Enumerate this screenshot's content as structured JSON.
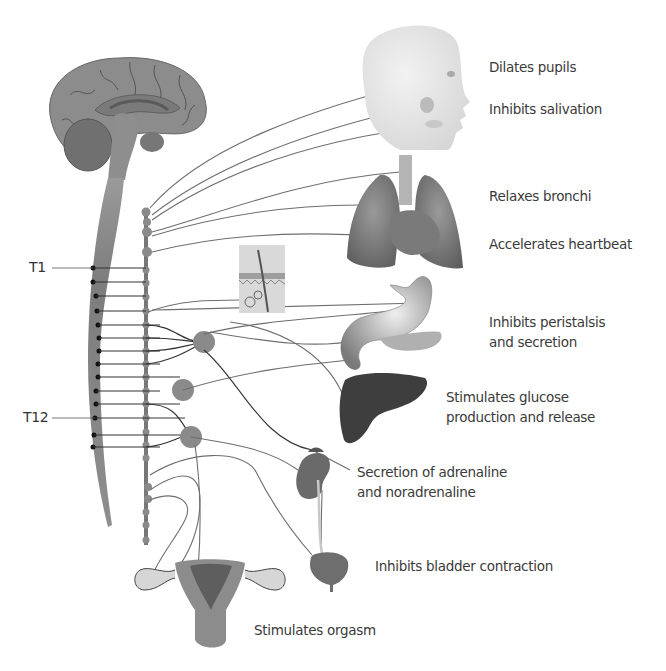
{
  "diagram": {
    "segment_labels": {
      "t1": "T1",
      "t12": "T12"
    },
    "effects": [
      {
        "organ": "eye",
        "line1": "Dilates pupils",
        "line2": ""
      },
      {
        "organ": "salivary-glands",
        "line1": "Inhibits salivation",
        "line2": ""
      },
      {
        "organ": "lungs",
        "line1": "Relaxes bronchi",
        "line2": ""
      },
      {
        "organ": "heart",
        "line1": "Accelerates heartbeat",
        "line2": ""
      },
      {
        "organ": "stomach",
        "line1": "Inhibits peristalsis",
        "line2": "and secretion"
      },
      {
        "organ": "liver",
        "line1": "Stimulates glucose",
        "line2": "production and release"
      },
      {
        "organ": "adrenal-gland",
        "line1": "Secretion of adrenaline",
        "line2": "and noradrenaline"
      },
      {
        "organ": "bladder",
        "line1": "Inhibits bladder contraction",
        "line2": ""
      },
      {
        "organ": "reproductive-organs",
        "line1": "Stimulates orgasm",
        "line2": ""
      }
    ],
    "colors": {
      "background": "#ffffff",
      "tissue": "#8c8c8c",
      "tissue_dark": "#6a6a6a",
      "nerve": "#6e6e6e",
      "text": "#3a3a3a"
    }
  }
}
